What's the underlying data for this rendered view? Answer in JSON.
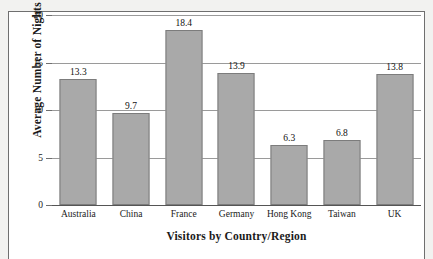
{
  "chart_data": {
    "type": "bar",
    "title": "",
    "xlabel": "Visitors by Country/Region",
    "ylabel": "Average Number of Nights",
    "categories": [
      "Australia",
      "China",
      "France",
      "Germany",
      "Hong Kong",
      "Taiwan",
      "UK"
    ],
    "values": [
      13.3,
      9.7,
      18.4,
      13.9,
      6.3,
      6.8,
      13.8
    ],
    "value_labels": [
      "13.3",
      "9.7",
      "18.4",
      "13.9",
      "6.3",
      "6.8",
      "13.8"
    ],
    "ylim": [
      0,
      20
    ],
    "ytick_values": [
      0,
      5,
      10,
      15,
      20
    ],
    "ytick_labels": [
      "0",
      "5",
      "10",
      "15",
      "20"
    ],
    "grid": true,
    "grid_axis": "y",
    "legend": false,
    "legend_position": "none",
    "bar_color": "#a9a9a9",
    "bar_border_color": "#7c7c7c",
    "gridline_color": "#9a9a9a",
    "axis_color": "#555555",
    "frame_color": "#6f6f6f",
    "plot_background": "#ffffff",
    "page_background": "#f2f2f0",
    "text_color": "#1a1a1a"
  }
}
